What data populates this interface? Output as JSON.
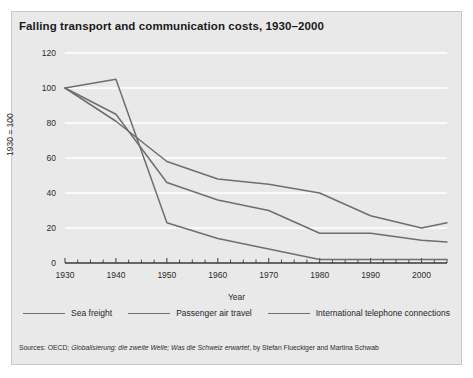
{
  "title": "Falling transport and communication costs, 1930–2000",
  "source": {
    "prefix": "Sources: OECD; ",
    "italic": "Globalisierung: die zweite Welle; Was die Schweiz erwartet",
    "suffix": ", by Stefan Flueckiger and Martina Schwab"
  },
  "colors": {
    "panel_background": "#e9e9e9",
    "page_background": "#ffffff",
    "line": "#6e6e72",
    "gridline": "#ffffff",
    "axis": "#3a3a3a",
    "text": "#1f1f1f"
  },
  "chart_data": {
    "type": "line",
    "title": "Falling transport and communication costs, 1930–2000",
    "xlabel": "Year",
    "ylabel": "1930 = 100",
    "xlim": [
      1930,
      2005
    ],
    "ylim": [
      0,
      120
    ],
    "yticks": [
      0,
      20,
      40,
      60,
      80,
      100,
      120
    ],
    "xticks": [
      1930,
      1940,
      1950,
      1960,
      1970,
      1980,
      1990,
      2000
    ],
    "xtick_labels": [
      "1930",
      "1940",
      "1950",
      "1960",
      "1970",
      "1980",
      "1990",
      "2000"
    ],
    "minor_tick_interval": 2.5,
    "grid": "horizontal",
    "legend_position": "bottom",
    "series": [
      {
        "name": "Sea freight",
        "x": [
          1930,
          1940,
          1950,
          1960,
          1970,
          1980,
          1990,
          2000,
          2005
        ],
        "values": [
          100,
          81,
          58,
          48,
          45,
          40,
          27,
          20,
          23
        ]
      },
      {
        "name": "Passenger air travel",
        "x": [
          1930,
          1940,
          1950,
          1960,
          1970,
          1980,
          1990,
          2000,
          2005
        ],
        "values": [
          100,
          85,
          46,
          36,
          30,
          17,
          17,
          13,
          12
        ]
      },
      {
        "name": "International telephone connections",
        "x": [
          1930,
          1940,
          1950,
          1960,
          1970,
          1980,
          1990,
          2000,
          2005
        ],
        "values": [
          100,
          105,
          23,
          14,
          8,
          2,
          2,
          2,
          2
        ]
      }
    ]
  }
}
